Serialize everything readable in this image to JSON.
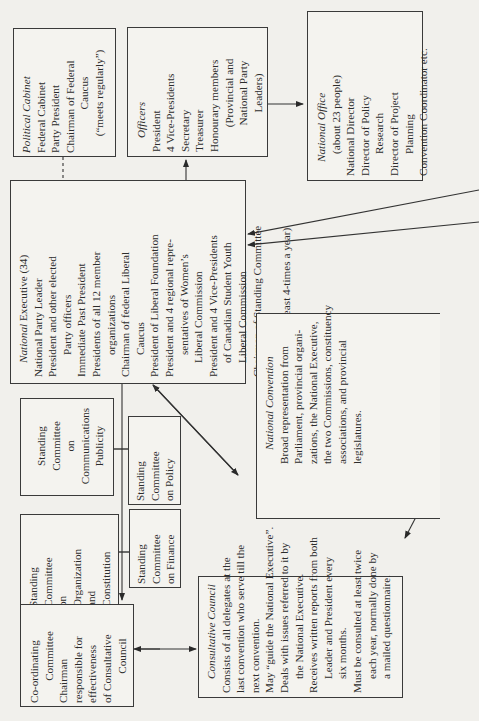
{
  "diagram": {
    "orientation": "rotated 90 degrees counter-clockwise",
    "boxes": {
      "political_cabinet": {
        "title": "Political Cabinet",
        "lines": [
          "Federal Cabinet",
          "Party President",
          "Chairman of Federal",
          "Caucus",
          "(“meets regularly”)"
        ]
      },
      "officers": {
        "title": "Officers",
        "lines": [
          "President",
          "4 Vice-Presidents",
          "Secretary",
          "Treasurer",
          "Honourary members",
          "(Provincial and",
          "National Party",
          "Leaders)"
        ]
      },
      "national_office": {
        "title": "National Office",
        "lines": [
          "(about 23 people)",
          "National Director",
          "Director of Policy",
          "Research",
          "Director of Project",
          "Planning",
          "Convention Coordinator etc."
        ]
      },
      "national_executive": {
        "title": "National Executive (34)",
        "lines": [
          "National Party Leader",
          "President and other elected",
          "Party officers",
          "Immediate Past President",
          "Presidents of all 12 member",
          "organizations",
          "Chairman of federal Liberal",
          "Caucus",
          "President of Liberal Foundation",
          "President and 4 regional repre-",
          "sentatives of Women’s",
          "Liberal Commission",
          "President and 4 Vice-Presidents",
          "of Canadian Student Youth",
          "Liberal Commission",
          "Chairman of Standing Committee",
          "on Finance",
          "(Meets at least 4-times a year)"
        ]
      },
      "committee_communications": {
        "lines": [
          "Standing",
          "Committee",
          "on",
          "Communications",
          "Publicity"
        ]
      },
      "committee_policy": {
        "lines": [
          "Standing",
          "Committee",
          "on Policy"
        ]
      },
      "committee_organization": {
        "lines": [
          "Standing",
          "Committee",
          "on",
          "Organization",
          "and",
          "Constitution"
        ]
      },
      "committee_finance": {
        "lines": [
          "Standing",
          "Committee",
          "on Finance"
        ]
      },
      "coordinating_committee": {
        "lines": [
          "Co-ordinating",
          "Committee",
          "Chairman",
          "responsible for",
          "effectiveness",
          "of Consultative",
          "Council"
        ]
      },
      "consultative_council": {
        "title": "Consultative Council",
        "lines": [
          "Consists of all delegates at the",
          "last convention who serve till the",
          "next convention.",
          "May “guide the National Executive”.",
          "Deals with issues referred to it by",
          "the National Executive.",
          "Receives written reports from both",
          "Leader and President every",
          "six months.",
          "Must be consulted at least twice",
          "each year, normally done by",
          "a mailed questionnaire."
        ]
      },
      "national_convention": {
        "title": "National Convention",
        "lines": [
          "Broad representation from",
          "Parliament, provincial organi-",
          "zations, the National Executive,",
          "the two Commissions, constituency",
          "associations, and provincial",
          "legislatures."
        ]
      }
    }
  }
}
